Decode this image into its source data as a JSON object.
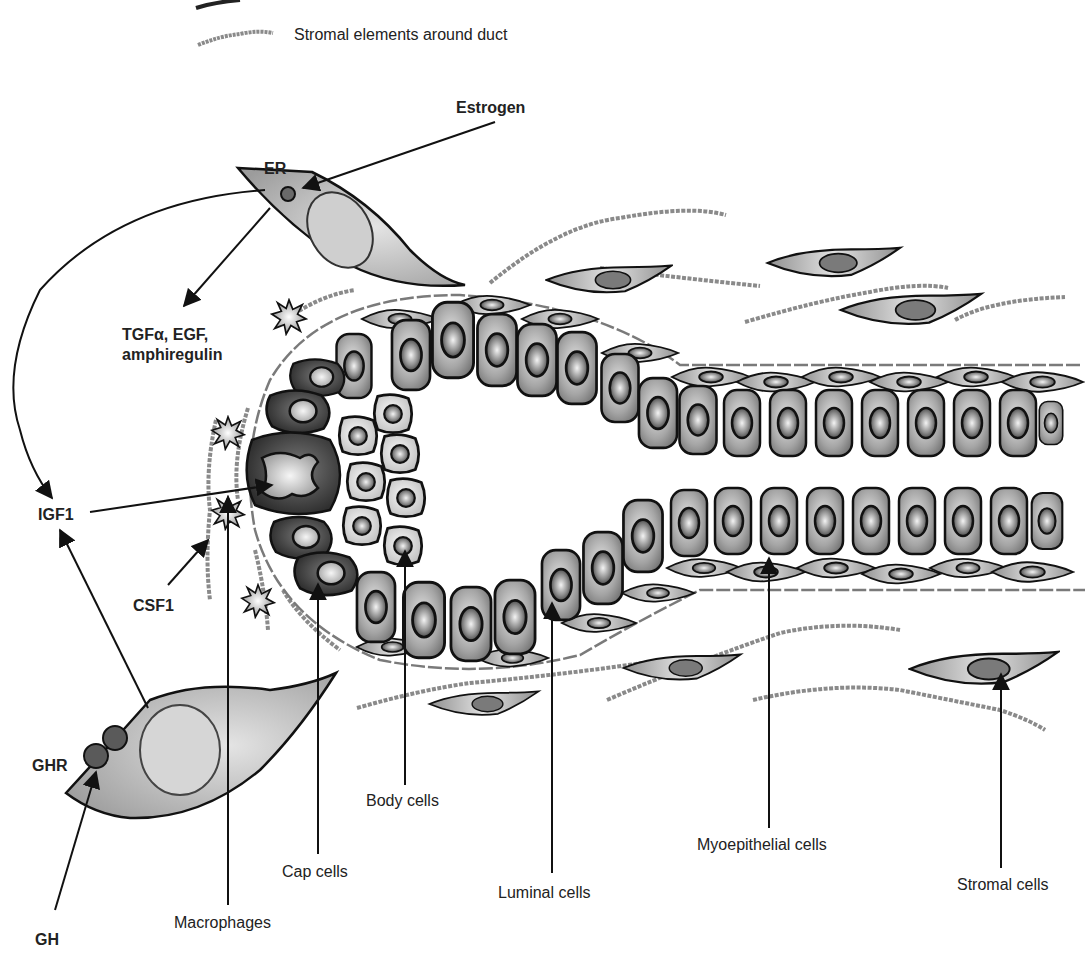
{
  "legend": {
    "stroma_label": "Stromal elements around duct"
  },
  "signals": {
    "estrogen": "Estrogen",
    "er": "ER",
    "growth_factors_line1": "TGFα, EGF,",
    "growth_factors_line2": "amphiregulin",
    "igf1": "IGF1",
    "csf1": "CSF1",
    "ghr": "GHR",
    "gh": "GH"
  },
  "cell_labels": {
    "macrophages": "Macrophages",
    "cap_cells": "Cap cells",
    "body_cells": "Body cells",
    "luminal_cells": "Luminal cells",
    "myoepithelial_cells": "Myoepithelial cells",
    "stromal_cells": "Stromal cells"
  },
  "colors": {
    "line": "#111111",
    "cap_cell": "#3a3a3a",
    "body_cell": "#e6e6e6",
    "luminal_cell": "#9a9a9a",
    "stroma_fiber": "#8a8a8a",
    "fibroblast": "#bdbdbd",
    "nucleus": "#6e6e6e"
  }
}
